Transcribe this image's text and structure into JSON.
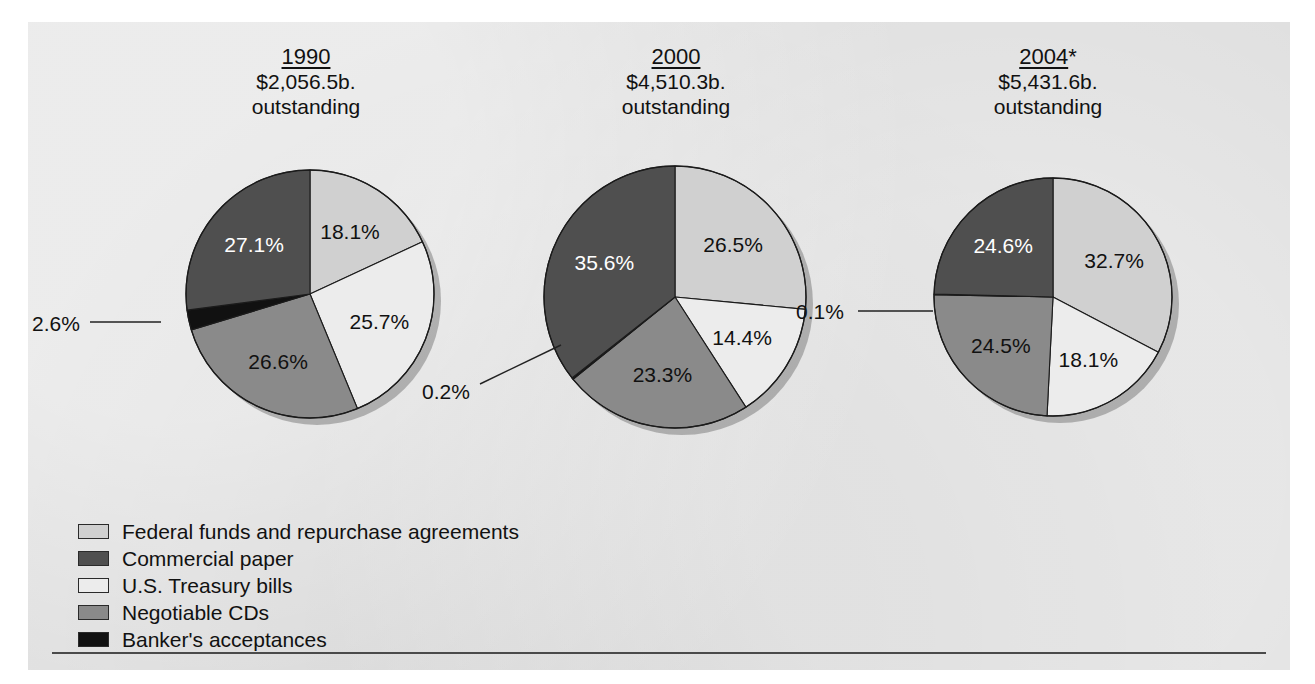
{
  "figure": {
    "ghost_text": "ghost bleed-through text",
    "background_color": "#dcdcdc"
  },
  "legend": {
    "items": [
      {
        "label": "Federal funds and repurchase agreements",
        "color": "#d0d0d0",
        "key": "federal-funds"
      },
      {
        "label": "Commercial paper",
        "color": "#4f4f4f",
        "key": "commercial-paper"
      },
      {
        "label": "U.S. Treasury bills",
        "color": "#ececec",
        "key": "treasury-bills"
      },
      {
        "label": "Negotiable CDs",
        "color": "#8a8a8a",
        "key": "negotiable-cds"
      },
      {
        "label": "Banker's acceptances",
        "color": "#111111",
        "key": "bankers-acceptances"
      }
    ]
  },
  "chart_data": {
    "type": "pie",
    "title": "",
    "legend_position": "bottom-left",
    "colors": {
      "federal-funds": "#d0d0d0",
      "commercial-paper": "#4f4f4f",
      "treasury-bills": "#ececec",
      "negotiable-cds": "#8a8a8a",
      "bankers-acceptances": "#111111"
    },
    "charts": [
      {
        "year": "1990",
        "year_suffix": "",
        "amount": "$2,056.5b.",
        "amount_note": "outstanding",
        "categories": [
          "Federal funds and repurchase agreements",
          "U.S. Treasury bills",
          "Negotiable CDs",
          "Banker's acceptances",
          "Commercial paper"
        ],
        "keys": [
          "federal-funds",
          "treasury-bills",
          "negotiable-cds",
          "bankers-acceptances",
          "commercial-paper"
        ],
        "values": [
          18.1,
          25.7,
          26.6,
          2.6,
          27.1
        ],
        "labels": [
          "18.1%",
          "25.7%",
          "26.6%",
          "2.6%",
          "27.1%"
        ],
        "callout_labels": [
          "2.6%"
        ]
      },
      {
        "year": "2000",
        "year_suffix": "",
        "amount": "$4,510.3b.",
        "amount_note": "outstanding",
        "categories": [
          "Federal funds and repurchase agreements",
          "U.S. Treasury bills",
          "Negotiable CDs",
          "Banker's acceptances",
          "Commercial paper"
        ],
        "keys": [
          "federal-funds",
          "treasury-bills",
          "negotiable-cds",
          "bankers-acceptances",
          "commercial-paper"
        ],
        "values": [
          26.5,
          14.4,
          23.3,
          0.2,
          35.6
        ],
        "labels": [
          "26.5%",
          "14.4%",
          "23.3%",
          "0.2%",
          "35.6%"
        ],
        "callout_labels": [
          "0.2%"
        ]
      },
      {
        "year": "2004",
        "year_suffix": "*",
        "amount": "$5,431.6b.",
        "amount_note": "outstanding",
        "categories": [
          "Federal funds and repurchase agreements",
          "U.S. Treasury bills",
          "Negotiable CDs",
          "Banker's acceptances",
          "Commercial paper"
        ],
        "keys": [
          "federal-funds",
          "treasury-bills",
          "negotiable-cds",
          "bankers-acceptances",
          "commercial-paper"
        ],
        "values": [
          32.7,
          18.1,
          24.5,
          0.1,
          24.6
        ],
        "labels": [
          "32.7%",
          "18.1%",
          "24.5%",
          "0.1%",
          "24.6%"
        ],
        "callout_labels": [
          "0.1%"
        ]
      }
    ]
  }
}
